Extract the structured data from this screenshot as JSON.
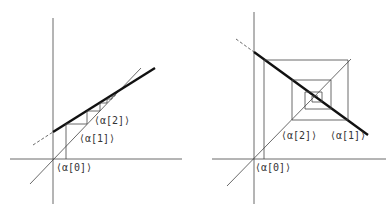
{
  "figures": [
    {
      "id": "left",
      "description": "Cobweb diagram, monotone convergence (positive slope less than 1)",
      "labels": [
        "⟨α[0]⟩",
        "⟨α[1]⟩",
        "⟨α[2]⟩"
      ]
    },
    {
      "id": "right",
      "description": "Cobweb diagram, oscillating convergence (negative slope)",
      "labels": [
        "⟨α[0]⟩",
        "⟨α[1]⟩",
        "⟨α[2]⟩"
      ]
    }
  ],
  "colors": {
    "line": "#333333",
    "thick": "#111111",
    "background": "#ffffff"
  }
}
